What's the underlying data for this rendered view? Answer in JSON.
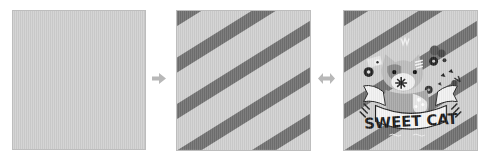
{
  "steps": [
    {
      "name": "plain-background",
      "fill_color": "#d0d0d0"
    },
    {
      "name": "striped-background",
      "light_color": "#d0d0d0",
      "stripe_color": "#707070"
    },
    {
      "name": "final-illustration",
      "light_color": "#d0d0d0",
      "stripe_color": "#707070",
      "banner_text": "SWEET CAT"
    }
  ],
  "connectors": [
    {
      "type": "arrow-right",
      "color": "#b8b8b8"
    },
    {
      "type": "arrow-both",
      "color": "#b8b8b8"
    }
  ]
}
